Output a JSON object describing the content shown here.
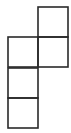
{
  "diagram": {
    "type": "matchstick-squares",
    "square_count": 5,
    "stroke_color": "#2a2a2a",
    "background": "#ffffff",
    "squares": [
      {
        "id": "top-right",
        "x": 38,
        "y": 7,
        "size": 30
      },
      {
        "id": "middle-left",
        "x": 8,
        "y": 37,
        "size": 30
      },
      {
        "id": "middle-right",
        "x": 38,
        "y": 37,
        "size": 30
      },
      {
        "id": "lower-left",
        "x": 8,
        "y": 68,
        "size": 30
      },
      {
        "id": "bottom-left",
        "x": 8,
        "y": 98,
        "size": 30
      }
    ]
  }
}
